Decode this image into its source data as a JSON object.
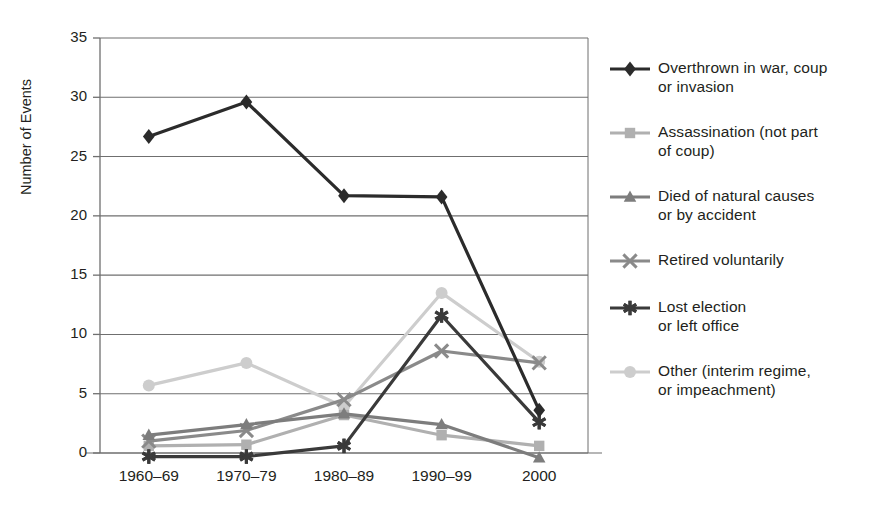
{
  "chart_data": {
    "type": "line",
    "title": "",
    "subtitle": "",
    "xlabel": "",
    "ylabel": "Number of Events",
    "categories": [
      "1960–69",
      "1970–79",
      "1980–89",
      "1990–99",
      "2000"
    ],
    "ylim": [
      -1.5,
      35
    ],
    "yticks": [
      0,
      5,
      10,
      15,
      20,
      25,
      30,
      35
    ],
    "ytick_labels": [
      "0",
      "5",
      "10",
      "15",
      "20",
      "25",
      "30",
      "35"
    ],
    "grid": "horizontal",
    "legend_position": "right",
    "series": [
      {
        "name": "Overthrown in war, coup\nor invasion",
        "marker": "diamond",
        "color": "#2b2b2b",
        "values": [
          26.7,
          29.6,
          21.7,
          21.6,
          3.6
        ]
      },
      {
        "name": "Assassination (not part\nof coup)",
        "marker": "square",
        "color": "#b0b0b0",
        "values": [
          0.6,
          0.7,
          3.2,
          1.5,
          0.6
        ]
      },
      {
        "name": "Died of natural causes\nor by accident",
        "marker": "triangle",
        "color": "#7d7d7d",
        "values": [
          1.5,
          2.4,
          3.3,
          2.4,
          -0.4
        ]
      },
      {
        "name": "Retired voluntarily",
        "marker": "x-cross",
        "color": "#8a8a8a",
        "values": [
          1.0,
          1.9,
          4.5,
          8.6,
          7.6
        ]
      },
      {
        "name": "Lost election\nor left office",
        "marker": "asterisk",
        "color": "#3a3a3a",
        "values": [
          -0.3,
          -0.3,
          0.6,
          11.6,
          2.6
        ]
      },
      {
        "name": "Other (interim regime,\nor impeachment)",
        "marker": "circle",
        "color": "#cdcdcd",
        "values": [
          5.7,
          7.6,
          3.9,
          13.5,
          7.7
        ]
      }
    ]
  },
  "axis": {
    "y_title": "Number of Events",
    "y_ticks": [
      "35",
      "30",
      "25",
      "20",
      "15",
      "10",
      "5",
      "0"
    ],
    "x_ticks": [
      "1960–69",
      "1970–79",
      "1980–89",
      "1990–99",
      "2000"
    ]
  },
  "legend": {
    "items": [
      {
        "label": "Overthrown in war, coup\nor invasion",
        "marker": "diamond",
        "color": "#2b2b2b"
      },
      {
        "label": "Assassination (not part\nof coup)",
        "marker": "square",
        "color": "#b0b0b0"
      },
      {
        "label": "Died of natural causes\nor by accident",
        "marker": "triangle",
        "color": "#7d7d7d"
      },
      {
        "label": "Retired voluntarily",
        "marker": "x-cross",
        "color": "#8a8a8a"
      },
      {
        "label": "Lost election\nor left office",
        "marker": "asterisk",
        "color": "#3a3a3a"
      },
      {
        "label": "Other (interim regime,\nor impeachment)",
        "marker": "circle",
        "color": "#cdcdcd"
      }
    ]
  }
}
